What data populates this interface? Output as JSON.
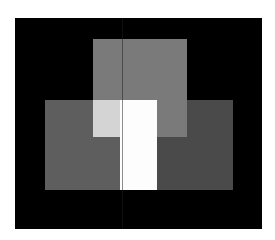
{
  "figure": {
    "background": "#ffffff",
    "frame": {
      "x": 15,
      "y": 18,
      "w": 247,
      "h": 211,
      "color": "#000000"
    },
    "seam": {
      "x": 122,
      "y": 18,
      "w": 1,
      "h": 211,
      "color": "#1c1c1c"
    },
    "shapes": [
      {
        "name": "left-rectangle",
        "x": 45,
        "y": 100,
        "w": 75,
        "h": 90,
        "color": "#5e5e5e"
      },
      {
        "name": "right-rectangle",
        "x": 157,
        "y": 100,
        "w": 76,
        "h": 90,
        "color": "#4a4a4a"
      },
      {
        "name": "top-square",
        "x": 93,
        "y": 39,
        "w": 94,
        "h": 98,
        "color": "#7a7a7a"
      },
      {
        "name": "left-overlap-region",
        "x": 93,
        "y": 100,
        "w": 27,
        "h": 37,
        "color": "#d4d4d4"
      },
      {
        "name": "center-white-column",
        "x": 120,
        "y": 100,
        "w": 37,
        "h": 90,
        "color": "#fdfdfd"
      }
    ]
  }
}
